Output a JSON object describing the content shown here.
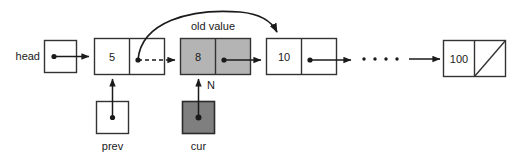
{
  "diagram": {
    "pointers": {
      "head_label": "head",
      "prev_label": "prev",
      "cur_label": "cur"
    },
    "annotations": {
      "old_value": "old value",
      "new_node_marker": "N"
    },
    "nodes": [
      {
        "value": "5",
        "style": "white"
      },
      {
        "value": "8",
        "style": "gray"
      },
      {
        "value": "10",
        "style": "white"
      },
      {
        "value": "100",
        "style": "white-null"
      }
    ],
    "ellipsis": "• • • •",
    "colors": {
      "stroke": "#1a1a1a",
      "box_stroke": "#333333",
      "node_gray": "#b4b4b4",
      "pointer_dark_gray": "#7f7f7f",
      "background": "#ffffff",
      "text": "#1a1a1a"
    }
  }
}
